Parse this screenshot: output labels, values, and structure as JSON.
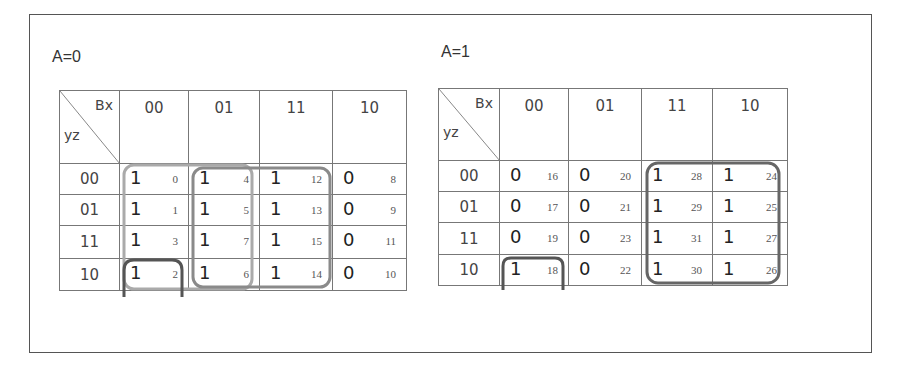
{
  "maps": [
    {
      "title": "A=0",
      "corner_top": "Bx",
      "corner_bottom": "yz",
      "col_headers": [
        "00",
        "01",
        "11",
        "10"
      ],
      "rows": [
        {
          "label": "00",
          "cells": [
            {
              "v": "1",
              "n": "0"
            },
            {
              "v": "1",
              "n": "4"
            },
            {
              "v": "1",
              "n": "12"
            },
            {
              "v": "0",
              "n": "8"
            }
          ]
        },
        {
          "label": "01",
          "cells": [
            {
              "v": "1",
              "n": "1"
            },
            {
              "v": "1",
              "n": "5"
            },
            {
              "v": "1",
              "n": "13"
            },
            {
              "v": "0",
              "n": "9"
            }
          ]
        },
        {
          "label": "11",
          "cells": [
            {
              "v": "1",
              "n": "3"
            },
            {
              "v": "1",
              "n": "7"
            },
            {
              "v": "1",
              "n": "15"
            },
            {
              "v": "0",
              "n": "11"
            }
          ]
        },
        {
          "label": "10",
          "cells": [
            {
              "v": "1",
              "n": "2"
            },
            {
              "v": "1",
              "n": "6"
            },
            {
              "v": "1",
              "n": "14"
            },
            {
              "v": "0",
              "n": "10"
            }
          ]
        }
      ],
      "groups": [
        {
          "name": "columns-00-01",
          "color": "#aaaaaa"
        },
        {
          "name": "columns-01-11",
          "color": "#8a8a8a"
        },
        {
          "name": "cell-2-wraparound",
          "color": "#555555"
        }
      ]
    },
    {
      "title": "A=1",
      "corner_top": "Bx",
      "corner_bottom": "yz",
      "col_headers": [
        "00",
        "01",
        "11",
        "10"
      ],
      "rows": [
        {
          "label": "00",
          "cells": [
            {
              "v": "0",
              "n": "16"
            },
            {
              "v": "0",
              "n": "20"
            },
            {
              "v": "1",
              "n": "28"
            },
            {
              "v": "1",
              "n": "24"
            }
          ]
        },
        {
          "label": "01",
          "cells": [
            {
              "v": "0",
              "n": "17"
            },
            {
              "v": "0",
              "n": "21"
            },
            {
              "v": "1",
              "n": "29"
            },
            {
              "v": "1",
              "n": "25"
            }
          ]
        },
        {
          "label": "11",
          "cells": [
            {
              "v": "0",
              "n": "19"
            },
            {
              "v": "0",
              "n": "23"
            },
            {
              "v": "1",
              "n": "31"
            },
            {
              "v": "1",
              "n": "27"
            }
          ]
        },
        {
          "label": "10",
          "cells": [
            {
              "v": "1",
              "n": "18"
            },
            {
              "v": "0",
              "n": "22"
            },
            {
              "v": "1",
              "n": "30"
            },
            {
              "v": "1",
              "n": "26"
            }
          ]
        }
      ],
      "groups": [
        {
          "name": "columns-11-10",
          "color": "#666666"
        },
        {
          "name": "cell-18-wraparound",
          "color": "#555555"
        }
      ]
    }
  ]
}
